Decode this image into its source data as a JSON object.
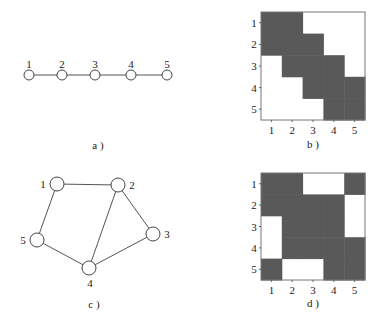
{
  "panels": {
    "a": {
      "caption": "a )",
      "nodes": [
        {
          "id": "1",
          "x": 29,
          "y": 75
        },
        {
          "id": "2",
          "x": 62,
          "y": 75
        },
        {
          "id": "3",
          "x": 95,
          "y": 75
        },
        {
          "id": "4",
          "x": 131,
          "y": 75
        },
        {
          "id": "5",
          "x": 167,
          "y": 75
        }
      ],
      "edges": [
        [
          "1",
          "2"
        ],
        [
          "2",
          "3"
        ],
        [
          "3",
          "4"
        ],
        [
          "4",
          "5"
        ]
      ]
    },
    "b": {
      "caption": "b )",
      "row_labels": [
        "1",
        "2",
        "3",
        "4",
        "5"
      ],
      "col_labels": [
        "1",
        "2",
        "3",
        "4",
        "5"
      ],
      "matrix": [
        [
          1,
          1,
          0,
          0,
          0
        ],
        [
          1,
          1,
          1,
          0,
          0
        ],
        [
          0,
          1,
          1,
          1,
          0
        ],
        [
          0,
          0,
          1,
          1,
          1
        ],
        [
          0,
          0,
          0,
          1,
          1
        ]
      ]
    },
    "c": {
      "caption": "c )",
      "nodes": [
        {
          "id": "1",
          "x": 57,
          "y": 184
        },
        {
          "id": "2",
          "x": 118,
          "y": 185
        },
        {
          "id": "3",
          "x": 153,
          "y": 234
        },
        {
          "id": "4",
          "x": 89,
          "y": 268
        },
        {
          "id": "5",
          "x": 37,
          "y": 240
        }
      ],
      "edges": [
        [
          "1",
          "2"
        ],
        [
          "1",
          "5"
        ],
        [
          "2",
          "3"
        ],
        [
          "2",
          "4"
        ],
        [
          "3",
          "4"
        ],
        [
          "4",
          "5"
        ]
      ]
    },
    "d": {
      "caption": "d )",
      "row_labels": [
        "1",
        "2",
        "3",
        "4",
        "5"
      ],
      "col_labels": [
        "1",
        "2",
        "3",
        "4",
        "5"
      ],
      "matrix": [
        [
          1,
          1,
          0,
          0,
          1
        ],
        [
          1,
          1,
          1,
          1,
          0
        ],
        [
          0,
          1,
          1,
          1,
          0
        ],
        [
          0,
          1,
          1,
          1,
          1
        ],
        [
          1,
          0,
          0,
          1,
          1
        ]
      ]
    }
  },
  "colors": {
    "filled_cell": "#595959",
    "background": "#ffffff"
  }
}
